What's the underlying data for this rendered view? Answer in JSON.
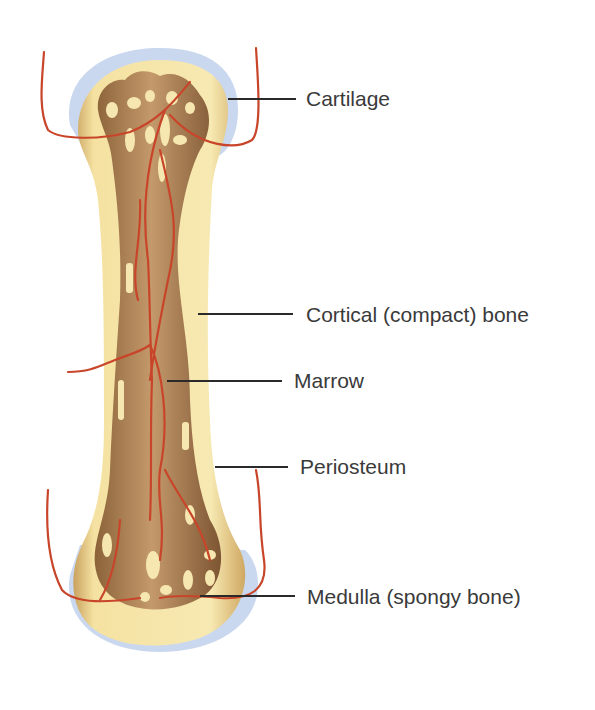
{
  "diagram": {
    "labels": [
      {
        "id": "cartilage",
        "text": "Cartilage"
      },
      {
        "id": "cortical",
        "text": "Cortical (compact) bone"
      },
      {
        "id": "marrow",
        "text": "Marrow"
      },
      {
        "id": "periosteum",
        "text": "Periosteum"
      },
      {
        "id": "medulla",
        "text": "Medulla (spongy bone)"
      }
    ],
    "colors": {
      "cartilage": "#c9d8ee",
      "compact_bone": "#f6e7a8",
      "marrow": "#a57b52",
      "spongy_bone": "#8a5a3a",
      "vessels": "#c8452a",
      "leader_lines": "#2a2a2a",
      "label_text": "#3a3a3a"
    }
  }
}
